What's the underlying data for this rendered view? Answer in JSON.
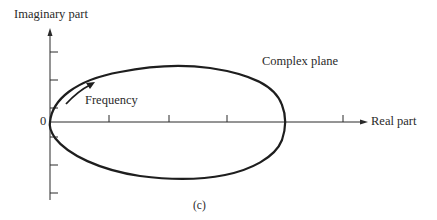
{
  "figure": {
    "y_axis_label": "Imaginary part",
    "x_axis_label": "Real part",
    "origin_label": "0",
    "plane_label": "Complex plane",
    "direction_label": "Frequency",
    "caption": "(c)"
  },
  "colors": {
    "ink": "#222222",
    "background": "#ffffff"
  }
}
